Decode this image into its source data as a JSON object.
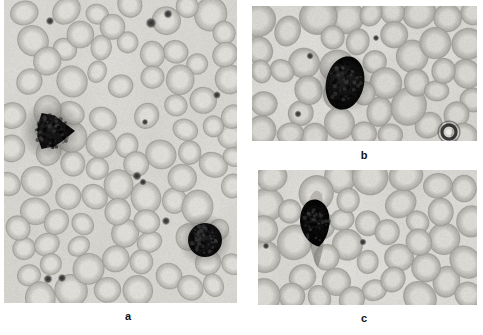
{
  "figure": {
    "width": 483,
    "height": 335,
    "background_color": "#ffffff",
    "type": "peripheral-blood-smear-micrograph",
    "panel_count": 3
  },
  "panels": [
    {
      "id": "a",
      "label": "a",
      "label_x": 118,
      "label_y": 310,
      "x": 4,
      "y": 0,
      "width": 233,
      "height": 303,
      "background_color": "#d9d7d3",
      "field_tint": "#d4d2cd",
      "description": "Low-power field with numerous pale erythrocytes, two darkly stained leukocytes and scattered platelets",
      "rbc_fill": "#cbc9c4",
      "rbc_edge": "#b3b1ab",
      "rbc_center": "#dedcd7",
      "dark_cell_color": "#141414",
      "platelet_color": "#2b2b2b",
      "rbc_count": 86,
      "leukocytes": [
        {
          "cx": 48,
          "cy": 131,
          "r": 20,
          "shape": "lobulated",
          "name": "dark-leukocyte-left"
        },
        {
          "cx": 201,
          "cy": 240,
          "r": 17,
          "shape": "round",
          "name": "dark-leukocyte-lower-right"
        }
      ],
      "platelets": [
        {
          "cx": 46,
          "cy": 21,
          "r": 2.6
        },
        {
          "cx": 147,
          "cy": 23,
          "r": 3.4
        },
        {
          "cx": 164,
          "cy": 14,
          "r": 2.8
        },
        {
          "cx": 213,
          "cy": 95,
          "r": 2.4
        },
        {
          "cx": 133,
          "cy": 176,
          "r": 2.8
        },
        {
          "cx": 139,
          "cy": 182,
          "r": 2.2
        },
        {
          "cx": 162,
          "cy": 221,
          "r": 2.6
        },
        {
          "cx": 44,
          "cy": 279,
          "r": 2.8
        },
        {
          "cx": 58,
          "cy": 278,
          "r": 2.6
        },
        {
          "cx": 141,
          "cy": 122,
          "r": 2.0
        }
      ]
    },
    {
      "id": "b",
      "label": "b",
      "label_x": 354,
      "label_y": 149,
      "x": 252,
      "y": 6,
      "width": 225,
      "height": 135,
      "background_color": "#d6d4d0",
      "field_tint": "#d2d0cb",
      "description": "Higher-power field centred on a single large dark oval leukocyte surrounded by erythrocytes",
      "rbc_fill": "#c4c2bd",
      "rbc_edge": "#aaa8a2",
      "rbc_center": "#d7d5d0",
      "dark_cell_color": "#161616",
      "platelet_color": "#2b2b2b",
      "rbc_count": 46,
      "leukocytes": [
        {
          "cx": 93,
          "cy": 77,
          "rx": 19,
          "ry": 27,
          "shape": "oval",
          "name": "dark-leukocyte-centre"
        }
      ],
      "platelets": [
        {
          "cx": 58,
          "cy": 50,
          "r": 2.2
        },
        {
          "cx": 124,
          "cy": 32,
          "r": 2.0
        },
        {
          "cx": 46,
          "cy": 108,
          "r": 2.2
        }
      ],
      "target_cell": {
        "cx": 197,
        "cy": 126,
        "r": 7,
        "name": "dark-ring-target-cell"
      }
    },
    {
      "id": "c",
      "label": "c",
      "label_x": 354,
      "label_y": 312,
      "x": 258,
      "y": 170,
      "width": 219,
      "height": 135,
      "background_color": "#d7d5d1",
      "field_tint": "#d3d1cc",
      "description": "Higher-power field showing a dark teardrop-shaped cell with a trailing tail among erythrocytes",
      "rbc_fill": "#c6c4bf",
      "rbc_edge": "#acaaa4",
      "rbc_center": "#dad8d3",
      "dark_cell_color": "#0c0c0c",
      "platelet_color": "#2b2b2b",
      "rbc_count": 40,
      "leukocytes": [
        {
          "cx": 58,
          "cy": 52,
          "rx": 17,
          "ry": 22,
          "shape": "teardrop-with-tail",
          "name": "dark-teardrop-cell"
        }
      ],
      "platelets": [
        {
          "cx": 8,
          "cy": 76,
          "r": 2.0
        },
        {
          "cx": 105,
          "cy": 72,
          "r": 2.2
        }
      ]
    }
  ]
}
